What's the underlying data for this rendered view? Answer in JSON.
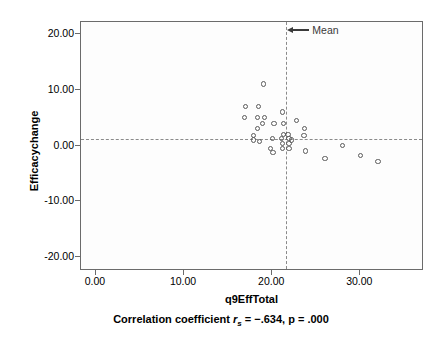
{
  "chart_data": {
    "type": "scatter",
    "title": "",
    "xlabel": "q9EffTotal",
    "ylabel": "Efficacychange",
    "caption_prefix": "Correlation coefficient ",
    "caption_symbol": "r",
    "caption_subscript": "s",
    "caption_stats": " = −.634, p = .000",
    "xlim": [
      -1.7,
      37.0
    ],
    "ylim": [
      -22.1,
      22.1
    ],
    "xticks": [
      0,
      10,
      20,
      30
    ],
    "xticklabels": [
      "0.00",
      "10.00",
      "20.00",
      "30.00"
    ],
    "yticks": [
      20,
      10,
      0,
      -10,
      -20
    ],
    "yticklabels": [
      "20.00",
      "10.00",
      "0.00",
      "-10.00",
      "-20.00"
    ],
    "grid": false,
    "legend": "none",
    "marker": "open-circle",
    "marker_color": "#5a5a5a",
    "reference_lines": [
      {
        "name": "mean-vertical",
        "orientation": "vertical",
        "value": 21.6,
        "style": "dashed",
        "color": "#8a8a8a"
      },
      {
        "name": "mean-horizontal",
        "orientation": "horizontal",
        "value": 1.2,
        "style": "dashed",
        "color": "#8a8a8a"
      }
    ],
    "annotations": [
      {
        "name": "mean-label",
        "text": "Mean",
        "x": 21.6,
        "y": 20.5,
        "arrow": "left"
      }
    ],
    "points": [
      {
        "x": 19.0,
        "y": 11.0
      },
      {
        "x": 17.0,
        "y": 7.0
      },
      {
        "x": 18.4,
        "y": 7.0
      },
      {
        "x": 16.9,
        "y": 5.0
      },
      {
        "x": 18.3,
        "y": 5.0
      },
      {
        "x": 19.1,
        "y": 5.0
      },
      {
        "x": 21.2,
        "y": 6.0
      },
      {
        "x": 18.9,
        "y": 4.0
      },
      {
        "x": 20.2,
        "y": 4.0
      },
      {
        "x": 21.3,
        "y": 4.0
      },
      {
        "x": 22.8,
        "y": 4.5
      },
      {
        "x": 18.3,
        "y": 3.0
      },
      {
        "x": 23.7,
        "y": 3.0
      },
      {
        "x": 17.9,
        "y": 1.8
      },
      {
        "x": 21.3,
        "y": 2.0
      },
      {
        "x": 21.8,
        "y": 2.0
      },
      {
        "x": 23.6,
        "y": 1.8
      },
      {
        "x": 17.9,
        "y": 1.0
      },
      {
        "x": 20.0,
        "y": 1.2
      },
      {
        "x": 21.1,
        "y": 1.2
      },
      {
        "x": 21.9,
        "y": 1.2
      },
      {
        "x": 22.2,
        "y": 1.0
      },
      {
        "x": 18.6,
        "y": 0.7
      },
      {
        "x": 21.2,
        "y": 0.3
      },
      {
        "x": 21.9,
        "y": 0.4
      },
      {
        "x": 21.2,
        "y": -0.5
      },
      {
        "x": 21.9,
        "y": -0.6
      },
      {
        "x": 19.8,
        "y": -0.5
      },
      {
        "x": 20.1,
        "y": -1.3
      },
      {
        "x": 23.8,
        "y": -1.0
      },
      {
        "x": 26.0,
        "y": -2.3
      },
      {
        "x": 28.0,
        "y": 0.0
      },
      {
        "x": 30.0,
        "y": -1.8
      },
      {
        "x": 32.0,
        "y": -2.8
      }
    ]
  }
}
